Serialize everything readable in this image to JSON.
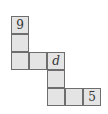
{
  "diagram": {
    "type": "grid-net",
    "cell_fill": "#e4e4e4",
    "cell_border": "#6e6e6e",
    "cells": [
      {
        "row": 0,
        "col": 0,
        "label": "9",
        "italic": false
      },
      {
        "row": 1,
        "col": 0,
        "label": "",
        "italic": false
      },
      {
        "row": 2,
        "col": 0,
        "label": "",
        "italic": false
      },
      {
        "row": 2,
        "col": 1,
        "label": "",
        "italic": false
      },
      {
        "row": 2,
        "col": 2,
        "label": "d",
        "italic": true
      },
      {
        "row": 3,
        "col": 2,
        "label": "",
        "italic": false
      },
      {
        "row": 4,
        "col": 2,
        "label": "",
        "italic": false
      },
      {
        "row": 4,
        "col": 3,
        "label": "",
        "italic": false
      },
      {
        "row": 4,
        "col": 4,
        "label": "5",
        "italic": false
      }
    ]
  }
}
